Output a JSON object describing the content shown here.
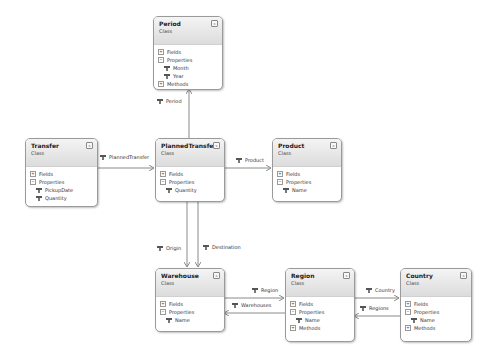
{
  "diagram": {
    "classes": {
      "period": {
        "name": "Period",
        "kind": "Class",
        "collapse": "«",
        "sections": {
          "fields": "Fields",
          "properties": "Properties",
          "methods": "Methods"
        },
        "properties": [
          "Month",
          "Year"
        ]
      },
      "transfer": {
        "name": "Transfer",
        "kind": "Class",
        "collapse": "«",
        "sections": {
          "fields": "Fields",
          "properties": "Properties"
        },
        "properties": [
          "PickupDate",
          "Quantity"
        ]
      },
      "planned_transfer": {
        "name": "PlannedTransfer",
        "kind": "Class",
        "collapse": "«",
        "sections": {
          "fields": "Fields",
          "properties": "Properties"
        },
        "properties": [
          "Quantity"
        ]
      },
      "product": {
        "name": "Product",
        "kind": "Class",
        "collapse": "«",
        "sections": {
          "fields": "Fields",
          "properties": "Properties"
        },
        "properties": [
          "Name"
        ]
      },
      "warehouse": {
        "name": "Warehouse",
        "kind": "Class",
        "collapse": "«",
        "sections": {
          "fields": "Fields",
          "properties": "Properties"
        },
        "properties": [
          "Name"
        ]
      },
      "region": {
        "name": "Region",
        "kind": "Class",
        "collapse": "«",
        "sections": {
          "fields": "Fields",
          "properties": "Properties",
          "methods": "Methods"
        },
        "properties": [
          "Name"
        ]
      },
      "country": {
        "name": "Country",
        "kind": "Class",
        "collapse": "«",
        "sections": {
          "fields": "Fields",
          "properties": "Properties",
          "methods": "Methods"
        },
        "properties": [
          "Name"
        ]
      }
    },
    "associations": {
      "period": "Period",
      "planned_transfer": "PlannedTransfer",
      "product": "Product",
      "origin": "Origin",
      "destination": "Destination",
      "region": "Region",
      "warehouses": "Warehouses",
      "country": "Country",
      "regions": "Regions"
    },
    "toggles": {
      "expanded": "−",
      "collapsed": "+"
    },
    "colors": {
      "line": "#8a8a8a",
      "border": "#9a9a9a",
      "header_top": "#f4f4f4",
      "header_bottom": "#dcdcdc"
    }
  }
}
